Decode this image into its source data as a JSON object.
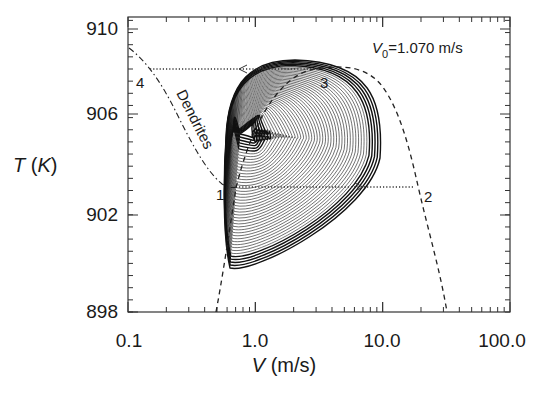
{
  "chart_data": {
    "type": "line",
    "title": "",
    "annotation": "V0=1.070 m/s",
    "annotation_parts": {
      "symbol": "V",
      "subscript": "0",
      "rest": "=1.070 m/s"
    },
    "xlabel": "V (m/s)",
    "xlabel_parts": {
      "symbol": "V",
      "unit": " (m/s)"
    },
    "ylabel": "T (K)",
    "ylabel_parts": {
      "symbol": "T",
      "open": " (",
      "unit": "K",
      "close": ")"
    },
    "xscale": "log",
    "xlim": [
      0.1,
      100.0
    ],
    "ylim": [
      898,
      910.5
    ],
    "xticks": [
      "0.1",
      "1.0",
      "10.0",
      "100.0"
    ],
    "yticks": [
      "898",
      "902",
      "906",
      "910"
    ],
    "grid": false,
    "curve_label": "Dendrites",
    "points": [
      {
        "label": "1",
        "V": 0.75,
        "T": 903.0
      },
      {
        "label": "2",
        "V": 19.0,
        "T": 903.0
      },
      {
        "label": "3",
        "V": 3.0,
        "T": 908.0
      },
      {
        "label": "4",
        "V": 0.13,
        "T": 908.0
      }
    ],
    "series": [
      {
        "name": "limit-cycle trajectory",
        "style": "solid",
        "description": "spiral orbits between ~0.7 and ~8 m/s, 898.9–908.3 K, converging to inner loop near V≈1.3 m/s, T≈905.6 K"
      },
      {
        "name": "stationary-state curve",
        "style": "dashed",
        "x": [
          0.5,
          0.7,
          0.75,
          1.0,
          2.0,
          3.0,
          5.0,
          8.0,
          12.0,
          19.0,
          25.0,
          33.0
        ],
        "y": [
          898.0,
          901.2,
          903.0,
          905.8,
          907.8,
          908.1,
          907.8,
          907.0,
          905.0,
          903.0,
          900.8,
          898.0
        ]
      },
      {
        "name": "Dendrites branch",
        "style": "dash-dot",
        "x": [
          0.1,
          0.13,
          0.2,
          0.3,
          0.45,
          0.6,
          0.75
        ],
        "y": [
          909.3,
          908.0,
          906.3,
          904.8,
          903.6,
          903.1,
          903.0
        ]
      },
      {
        "name": "jump 1→2",
        "style": "dotted",
        "x": [
          0.75,
          19.0
        ],
        "y": [
          903.0,
          903.0
        ],
        "arrow": "right"
      },
      {
        "name": "jump 3→4",
        "style": "dotted",
        "x": [
          3.0,
          0.13
        ],
        "y": [
          908.0,
          908.0
        ],
        "arrow": "left"
      }
    ]
  }
}
